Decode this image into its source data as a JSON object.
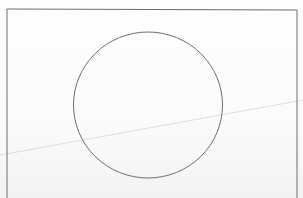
{
  "scene": {
    "description": "Photographed sheet of paper with a hand-drawn rectangular frame containing a circle, crossed by a faint diagonal crease line",
    "colors": {
      "paper": "#fdfdfd",
      "ink": "#6e6e6e",
      "crease": "#d9d9d9"
    },
    "frame": {
      "x": 7,
      "y": 9,
      "right": 297,
      "bottom": 198
    },
    "circle": {
      "cx": 148,
      "cy": 105,
      "rx": 74.5,
      "ry": 73
    },
    "crease_line": {
      "x1": 0,
      "y1": 155,
      "x2": 303,
      "y2": 100
    }
  }
}
